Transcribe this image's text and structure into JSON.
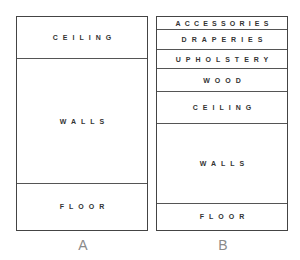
{
  "diagram_a": {
    "caption": "A",
    "segments": [
      {
        "label": "CEILING"
      },
      {
        "label": "WALLS"
      },
      {
        "label": "FLOOR"
      }
    ]
  },
  "diagram_b": {
    "caption": "B",
    "segments": [
      {
        "label": "ACCESSORIES"
      },
      {
        "label": "DRAPERIES"
      },
      {
        "label": "UPHOLSTERY"
      },
      {
        "label": "WOOD"
      },
      {
        "label": "CEILING"
      },
      {
        "label": "WALLS"
      },
      {
        "label": "FLOOR"
      }
    ]
  },
  "colors": {
    "line": "#444444",
    "text": "#333333",
    "caption": "#8a8a8a"
  }
}
